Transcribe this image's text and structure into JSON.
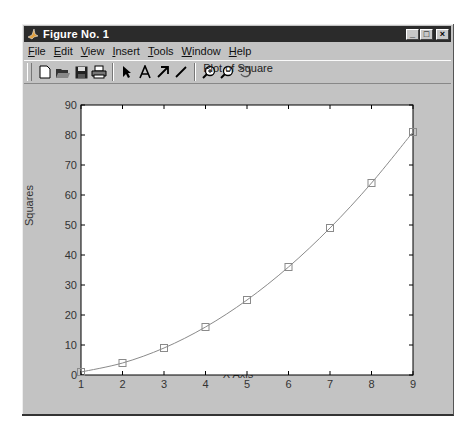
{
  "window": {
    "title": "Figure No. 1",
    "controls": {
      "minimize": "_",
      "maximize": "□",
      "close": "×"
    }
  },
  "menubar": {
    "items": [
      {
        "label": "File",
        "mnemonic": "F"
      },
      {
        "label": "Edit",
        "mnemonic": "E"
      },
      {
        "label": "View",
        "mnemonic": "V"
      },
      {
        "label": "Insert",
        "mnemonic": "I"
      },
      {
        "label": "Tools",
        "mnemonic": "T"
      },
      {
        "label": "Window",
        "mnemonic": "W"
      },
      {
        "label": "Help",
        "mnemonic": "H"
      }
    ]
  },
  "toolbar": {
    "groups": [
      [
        "new-file-icon",
        "open-folder-icon",
        "save-disk-icon",
        "print-icon"
      ],
      [
        "select-arrow-icon",
        "insert-text-icon",
        "insert-arrow-icon",
        "insert-line-icon"
      ],
      [
        "zoom-in-icon",
        "zoom-out-icon",
        "rotate-icon"
      ]
    ]
  },
  "colors": {
    "window_bg": "#c3c3c3",
    "titlebar_bg": "#2b2b2b",
    "axes_bg": "#ffffff",
    "line": "#8a8a8a",
    "marker": "#8a8a8a"
  },
  "chart_data": {
    "type": "line",
    "title": "Plot of Square",
    "xlabel": "X Axis",
    "ylabel": "Squares",
    "x": [
      1,
      2,
      3,
      4,
      5,
      6,
      7,
      8,
      9
    ],
    "series": [
      {
        "name": "Squares",
        "values": [
          1,
          4,
          9,
          16,
          25,
          36,
          49,
          64,
          81
        ],
        "marker": "square",
        "smooth": true
      }
    ],
    "xlim": [
      1,
      9
    ],
    "ylim": [
      0,
      90
    ],
    "xticks": [
      1,
      2,
      3,
      4,
      5,
      6,
      7,
      8,
      9
    ],
    "yticks": [
      0,
      10,
      20,
      30,
      40,
      50,
      60,
      70,
      80,
      90
    ],
    "grid": false,
    "legend": null
  }
}
